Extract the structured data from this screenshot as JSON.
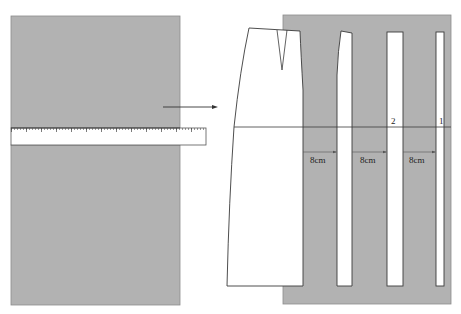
{
  "figure": {
    "colors": {
      "fabric": "#b2b2b2",
      "fabric_edge": "#8c8c8c",
      "line": "#3a3a3a",
      "paper": "#ffffff"
    },
    "left_panel": {
      "ruler": {
        "label": ""
      }
    },
    "right_panel": {
      "slash_markers": [
        {
          "id": "2",
          "label": "2"
        },
        {
          "id": "1",
          "label": "1"
        }
      ],
      "spread_labels": [
        {
          "label": "8cm"
        },
        {
          "label": "8cm"
        },
        {
          "label": "8cm"
        }
      ]
    }
  }
}
